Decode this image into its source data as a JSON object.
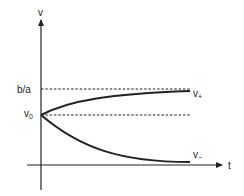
{
  "diagram": {
    "type": "phase-plot",
    "axes": {
      "y_label": "v",
      "x_label": "t"
    },
    "levels": [
      {
        "id": "b_over_a",
        "label": "b/a",
        "style": "dashed"
      },
      {
        "id": "v0",
        "label": "v",
        "subscript": "0",
        "style": "dashed"
      }
    ],
    "curves": [
      {
        "id": "v_plus",
        "label": "v",
        "subscript": "+",
        "description": "rises from v0 toward b/a"
      },
      {
        "id": "v_minus",
        "label": "v",
        "subscript": "−",
        "description": "decays from v0 toward 0"
      }
    ],
    "colors": {
      "line": "#222222",
      "background": "#ffffff"
    }
  }
}
